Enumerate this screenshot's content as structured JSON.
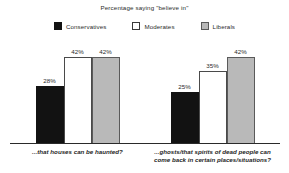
{
  "chart_data": {
    "type": "bar",
    "title": "Percentage saying \"believe in\"",
    "xlabel": "",
    "ylabel": "",
    "ylim": [
      0,
      50
    ],
    "grid": false,
    "legend_position": "top",
    "categories": [
      "...that houses can be haunted?",
      "...ghosts/that spirits of dead people can come back in certain places/situations?"
    ],
    "series": [
      {
        "name": "Conservatives",
        "color": "#121212",
        "values": [
          28,
          25
        ],
        "labels": [
          "28%",
          "25%"
        ]
      },
      {
        "name": "Moderates",
        "color": "#ffffff",
        "values": [
          42,
          35
        ],
        "labels": [
          "42%",
          "35%"
        ]
      },
      {
        "name": "Liberals",
        "color": "#b9b9b9",
        "values": [
          42,
          42
        ],
        "labels": [
          "42%",
          "42%"
        ]
      }
    ]
  },
  "legend": {
    "items": [
      {
        "label": "Conservatives"
      },
      {
        "label": "Moderates"
      },
      {
        "label": "Liberals"
      }
    ]
  }
}
